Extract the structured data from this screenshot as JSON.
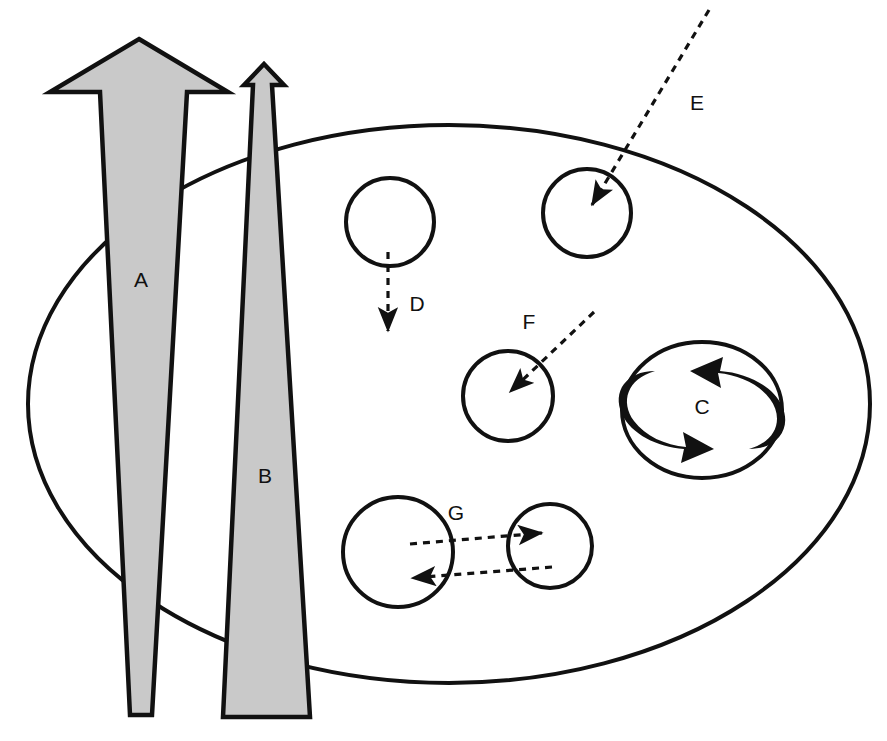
{
  "diagram": {
    "background_color": "#ffffff",
    "stroke_color": "#111111",
    "arrow_fill_color": "#c9c9c9",
    "cycle_arrow_color": "#111111",
    "width": 887,
    "height": 741
  },
  "boundary": {
    "name": "outer-ellipse",
    "shape": "ellipse",
    "cx": 449,
    "cy": 404,
    "rx": 421,
    "ry": 279,
    "stroke_width": 4
  },
  "block_arrows": [
    {
      "id": "A",
      "label": "A",
      "direction": "up",
      "label_x": 141,
      "label_y": 281,
      "points": "139,39 228,92 187,92 152,715 130,715 100,92 50,92",
      "description": "large upward block arrow tapering downward"
    },
    {
      "id": "B",
      "label": "B",
      "direction": "up",
      "label_x": 265,
      "label_y": 477,
      "points": "264,64 284,85 272,85 310,717 223,717 253,85 244,85",
      "description": "narrow upward block arrow widening downward"
    }
  ],
  "nodes": [
    {
      "id": "E-node",
      "label": "",
      "cx": 587,
      "cy": 213,
      "r": 44,
      "stroke_width": 4
    },
    {
      "id": "D-node",
      "label": "",
      "cx": 390,
      "cy": 222,
      "r": 44,
      "stroke_width": 4
    },
    {
      "id": "F-node",
      "label": "",
      "cx": 508,
      "cy": 396,
      "r": 45,
      "stroke_width": 4
    },
    {
      "id": "G-left-node",
      "label": "",
      "cx": 398,
      "cy": 552,
      "r": 55,
      "stroke_width": 4
    },
    {
      "id": "G-right-node",
      "label": "",
      "cx": 550,
      "cy": 546,
      "r": 42,
      "stroke_width": 4
    },
    {
      "id": "C-node",
      "label": "C",
      "cx": 702,
      "cy": 410,
      "rx": 80,
      "ry": 68,
      "label_x": 702,
      "label_y": 408,
      "stroke_width": 4
    }
  ],
  "dashed_flows": [
    {
      "id": "E",
      "label": "E",
      "label_x": 697,
      "label_y": 104,
      "x1": 709,
      "y1": 10,
      "x2": 592,
      "y2": 205,
      "description": "dashed arrow pointing down-left into the E node from outside the boundary"
    },
    {
      "id": "D",
      "label": "D",
      "label_x": 417,
      "label_y": 305,
      "x1": 388,
      "y1": 252,
      "x2": 388,
      "y2": 331,
      "description": "dashed arrow pointing straight down out of the D node"
    },
    {
      "id": "F",
      "label": "F",
      "label_x": 529,
      "label_y": 323,
      "x1": 594,
      "y1": 312,
      "x2": 510,
      "y2": 392,
      "description": "dashed arrow pointing down-left into the F node"
    },
    {
      "id": "G-forward",
      "label": "G",
      "label_x": 456,
      "label_y": 514,
      "x1": 410,
      "y1": 544,
      "x2": 542,
      "y2": 533,
      "description": "dashed arrow from left node to right node"
    },
    {
      "id": "G-return",
      "label": "",
      "label_x": 0,
      "label_y": 0,
      "x1": 552,
      "y1": 567,
      "x2": 412,
      "y2": 578,
      "description": "dashed arrow from right node back to left node"
    }
  ],
  "cycle_arrows": {
    "id": "C-cycle",
    "label": "C",
    "description": "two thick curved arrows forming a clockwise cycle inside the C node",
    "left_arc_path": "M 655 371 C 627 379 620 402 634 421 C 645 436 665 445 686 447 L 683 432 L 714 449 L 681 463 L 684 449 C 657 447 631 434 622 414 C 612 392 626 371 655 371 Z",
    "right_arc_path": "M 749 449 C 777 441 784 418 770 399 C 759 384 739 375 718 373 L 721 388 L 690 371 L 723 357 L 720 371 C 747 373 773 386 782 406 C 792 428 778 449 749 449 Z"
  }
}
